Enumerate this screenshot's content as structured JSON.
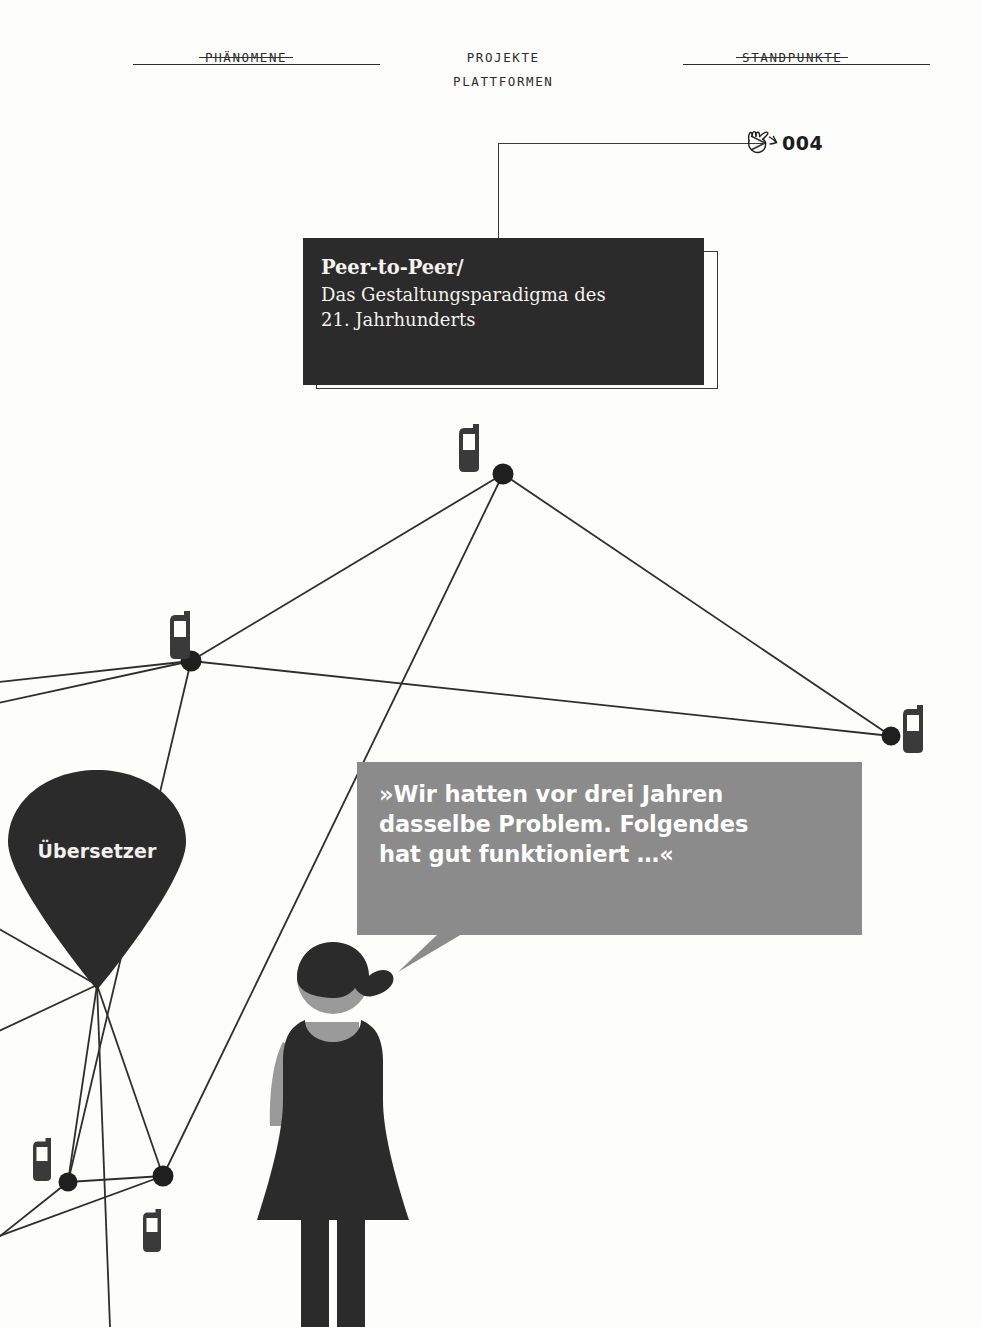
{
  "page": {
    "background_color": "#fdfdfc",
    "width": 982,
    "height": 1327
  },
  "header": {
    "nav": [
      {
        "label": "PHÄNOMENE",
        "struck": true
      },
      {
        "label": "PROJEKTE",
        "label2": "PLATTFORMEN",
        "struck": false
      },
      {
        "label": "STANDPUNKTE",
        "struck": true
      }
    ]
  },
  "callout": {
    "icon": "pointing-hand-icon",
    "number": "004"
  },
  "title": {
    "headline": "Peer-to-Peer/",
    "subline_1": "Das Gestaltungsparadigma des",
    "subline_2": "21. Jahrhunderts",
    "box_color": "#2b2b2b",
    "text_color": "#f4f2ee"
  },
  "pin": {
    "label": "Übersetzer",
    "color": "#2b2b2b",
    "text_color": "#f2f0ec"
  },
  "speech": {
    "line_1": "»Wir hatten vor drei Jahren",
    "line_2": "dasselbe Problem. Folgendes",
    "line_3": "hat gut funktioniert …«",
    "bubble_color": "#8b8b8b",
    "text_color": "#ffffff"
  },
  "figure": {
    "name": "woman-with-headscarf",
    "dark_color": "#2b2b2b",
    "skin_color": "#9a9a9a"
  },
  "network": {
    "node_color": "#1f1f1f",
    "edge_color": "#2e2e2e",
    "phone_icon_color": "#3a3a3a",
    "nodes": [
      {
        "id": "hub",
        "x": 503,
        "y": 474,
        "r": 10
      },
      {
        "id": "left-mid",
        "x": 191,
        "y": 661,
        "r": 10
      },
      {
        "id": "right",
        "x": 891,
        "y": 736,
        "r": 9
      },
      {
        "id": "bottom-left",
        "x": 68,
        "y": 1182,
        "r": 9
      },
      {
        "id": "bottom-mid",
        "x": 163,
        "y": 1176,
        "r": 10
      },
      {
        "id": "pin-tip",
        "x": 97,
        "y": 985,
        "r": 0
      }
    ],
    "phones": [
      {
        "x": 459,
        "y": 424
      },
      {
        "x": 170,
        "y": 611
      },
      {
        "x": 905,
        "y": 705
      },
      {
        "x": 38,
        "y": 1138
      },
      {
        "x": 148,
        "y": 1209
      }
    ],
    "edges": [
      [
        "hub",
        "left-mid"
      ],
      [
        "hub",
        "right"
      ],
      [
        "hub",
        "bottom-mid"
      ],
      [
        "left-mid",
        "right"
      ],
      [
        "left-mid",
        "bottom-left"
      ]
    ]
  }
}
